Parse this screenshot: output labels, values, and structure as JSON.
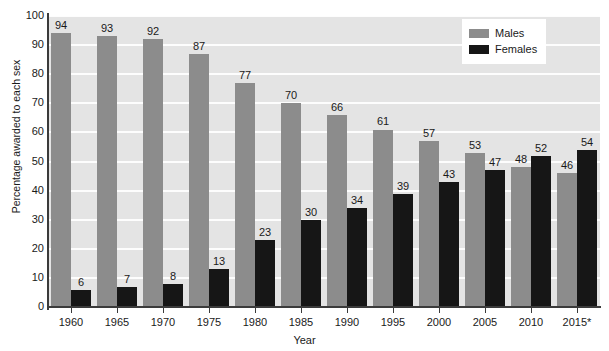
{
  "chart_data": {
    "type": "bar",
    "title": "",
    "xlabel": "Year",
    "ylabel": "Percentage awarded to each sex",
    "categories": [
      "1960",
      "1965",
      "1970",
      "1975",
      "1980",
      "1985",
      "1990",
      "1995",
      "2000",
      "2005",
      "2010",
      "2015*"
    ],
    "series": [
      {
        "name": "Males",
        "color": "#8c8c8c",
        "values": [
          94,
          93,
          92,
          87,
          77,
          70,
          66,
          61,
          57,
          53,
          48,
          46
        ]
      },
      {
        "name": "Females",
        "color": "#161616",
        "values": [
          6,
          7,
          8,
          13,
          23,
          30,
          34,
          39,
          43,
          47,
          52,
          54
        ]
      }
    ],
    "ylim": [
      0,
      100
    ],
    "yticks": [
      0,
      10,
      20,
      30,
      40,
      50,
      60,
      70,
      80,
      90,
      100
    ],
    "grid": true,
    "legend_position": "top-right",
    "plot_background": "#e4e4e4",
    "gridline_color": "#fdfdfd",
    "axis_color": "#3b3b3b",
    "data_labels_shown": true
  },
  "legend": {
    "items": [
      {
        "label": "Males"
      },
      {
        "label": "Females"
      }
    ]
  },
  "axes": {
    "y_title": "Percentage awarded to each sex",
    "x_title": "Year"
  }
}
